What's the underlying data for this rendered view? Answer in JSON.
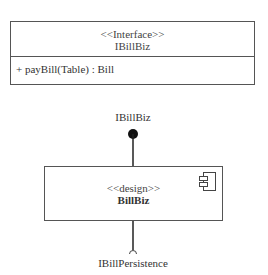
{
  "interface_class": {
    "stereotype": "<<Interface>>",
    "name": "IBillBiz",
    "operations": [
      "+ payBill(Table) : Bill"
    ]
  },
  "component": {
    "provided_interface": "IBillBiz",
    "stereotype": "<<design>>",
    "name": "BillBiz",
    "required_interface": "IBillPersistence",
    "icon": "component-icon"
  },
  "colors": {
    "line": "#555555",
    "text": "#333333",
    "background": "#ffffff"
  }
}
